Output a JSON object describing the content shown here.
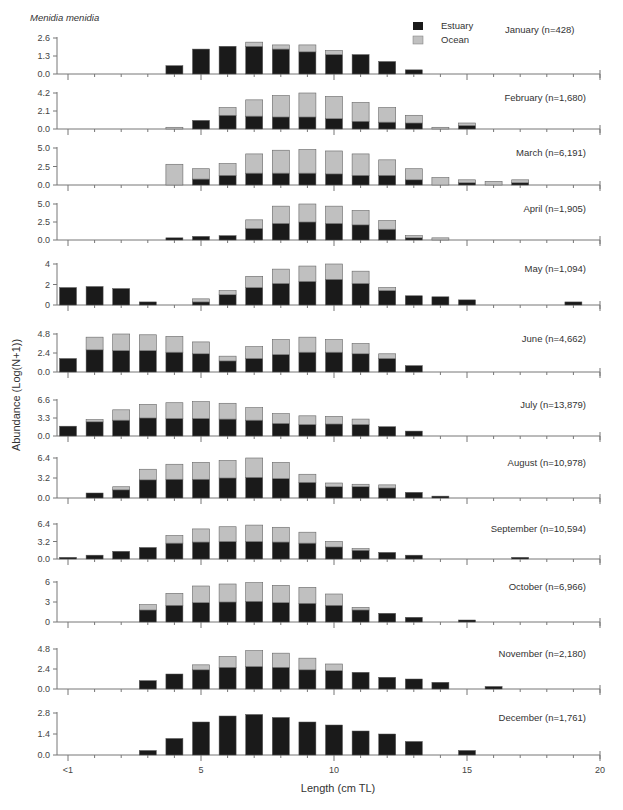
{
  "chart_data": {
    "type": "bar",
    "stacked": true,
    "title": "Menidia menidia",
    "xlabel": "Length (cm TL)",
    "ylabel": "Abundance (Log(N+1))",
    "categories": [
      "<1",
      "1",
      "2",
      "3",
      "4",
      "5",
      "6",
      "7",
      "8",
      "9",
      "10",
      "11",
      "12",
      "13",
      "14",
      "15",
      "16",
      "17",
      "18",
      "19",
      "20"
    ],
    "x_tick_labels": {
      "0": "<1",
      "5": "5",
      "10": "10",
      "15": "15",
      "20": "20"
    },
    "legend": [
      {
        "name": "Estuary",
        "color": "#1a1a1a"
      },
      {
        "name": "Ocean",
        "color": "#c0c0c0"
      }
    ],
    "legend_position": "top-right",
    "grid": false,
    "panels": [
      {
        "label": "January (n=428)",
        "yticks": [
          "0.0",
          "1.3",
          "2.6"
        ],
        "ylim": [
          0,
          2.6
        ],
        "series": [
          {
            "name": "Estuary",
            "values": [
              0,
              0,
              0,
              0,
              0.6,
              1.8,
              2.0,
              2.0,
              1.8,
              1.6,
              1.4,
              1.4,
              0.9,
              0.3,
              0,
              0,
              0,
              0,
              0,
              0,
              0
            ]
          },
          {
            "name": "Ocean",
            "values": [
              0,
              0,
              0,
              0,
              0,
              0,
              0,
              0.3,
              0.3,
              0.5,
              0.3,
              0,
              0,
              0,
              0,
              0,
              0,
              0,
              0,
              0,
              0
            ]
          }
        ]
      },
      {
        "label": "February (n=1,680)",
        "yticks": [
          "0.0",
          "2.1",
          "4.2"
        ],
        "ylim": [
          0,
          4.2
        ],
        "series": [
          {
            "name": "Estuary",
            "values": [
              0,
              0,
              0,
              0,
              0,
              1.0,
              1.6,
              1.5,
              1.4,
              1.4,
              1.2,
              0.9,
              0.8,
              0.7,
              0,
              0.4,
              0,
              0,
              0,
              0,
              0
            ]
          },
          {
            "name": "Ocean",
            "values": [
              0,
              0,
              0,
              0,
              0.2,
              0,
              0.9,
              1.9,
              2.5,
              2.8,
              2.6,
              2.2,
              1.7,
              0.9,
              0.2,
              0.3,
              0,
              0,
              0,
              0,
              0
            ]
          }
        ]
      },
      {
        "label": "March (n=6,191)",
        "yticks": [
          "0.0",
          "2.5",
          "5.0"
        ],
        "ylim": [
          0,
          5.0
        ],
        "series": [
          {
            "name": "Estuary",
            "values": [
              0,
              0,
              0,
              0,
              0,
              0.8,
              1.3,
              1.6,
              1.6,
              1.6,
              1.5,
              1.3,
              1.3,
              0.7,
              0,
              0.3,
              0,
              0.3,
              0,
              0,
              0
            ]
          },
          {
            "name": "Ocean",
            "values": [
              0,
              0,
              0,
              0,
              2.8,
              1.4,
              1.6,
              2.6,
              3.1,
              3.2,
              3.1,
              2.9,
              2.1,
              1.5,
              1.0,
              0.4,
              0.5,
              0.4,
              0,
              0,
              0
            ]
          }
        ]
      },
      {
        "label": "April (n=1,905)",
        "yticks": [
          "0.0",
          "2.5",
          "5.0"
        ],
        "ylim": [
          0,
          5.0
        ],
        "series": [
          {
            "name": "Estuary",
            "values": [
              0,
              0,
              0,
              0,
              0.3,
              0.5,
              0.6,
              1.6,
              2.3,
              2.5,
              2.3,
              2.1,
              1.5,
              0.3,
              0,
              0,
              0,
              0,
              0,
              0,
              0
            ]
          },
          {
            "name": "Ocean",
            "values": [
              0,
              0,
              0,
              0,
              0,
              0,
              0,
              1.2,
              2.4,
              2.5,
              2.4,
              2.0,
              1.2,
              0.3,
              0.3,
              0,
              0,
              0,
              0,
              0,
              0
            ]
          }
        ]
      },
      {
        "label": "May (n=1,094)",
        "yticks": [
          "0",
          "2",
          "4"
        ],
        "ylim": [
          0,
          4
        ],
        "series": [
          {
            "name": "Estuary",
            "values": [
              1.7,
              1.8,
              1.6,
              0.3,
              0,
              0.3,
              1.0,
              1.7,
              2.1,
              2.3,
              2.5,
              2.1,
              1.4,
              0.9,
              0.8,
              0.5,
              0,
              0,
              0,
              0.3,
              0
            ]
          },
          {
            "name": "Ocean",
            "values": [
              0,
              0,
              0,
              0,
              0,
              0.3,
              0.4,
              1.1,
              1.4,
              1.5,
              1.5,
              1.2,
              0.3,
              0,
              0,
              0,
              0,
              0,
              0,
              0,
              0
            ]
          }
        ]
      },
      {
        "label": "June (n=4,662)",
        "yticks": [
          "0.0",
          "2.4",
          "4.8"
        ],
        "ylim": [
          0,
          4.8
        ],
        "series": [
          {
            "name": "Estuary",
            "values": [
              1.7,
              2.8,
              2.7,
              2.7,
              2.5,
              2.3,
              1.4,
              1.7,
              2.2,
              2.5,
              2.5,
              2.3,
              1.7,
              0.8,
              0,
              0,
              0,
              0,
              0,
              0,
              0
            ]
          },
          {
            "name": "Ocean",
            "values": [
              0,
              1.6,
              2.1,
              2.0,
              2.0,
              1.5,
              0.6,
              1.5,
              1.9,
              1.9,
              1.6,
              1.3,
              0.6,
              0,
              0,
              0,
              0,
              0,
              0,
              0,
              0
            ]
          }
        ]
      },
      {
        "label": "July (n=13,879)",
        "yticks": [
          "0.0",
          "3.3",
          "6.6"
        ],
        "ylim": [
          0,
          6.6
        ],
        "series": [
          {
            "name": "Estuary",
            "values": [
              1.8,
              2.6,
              2.9,
              3.3,
              3.2,
              3.2,
              3.1,
              2.9,
              2.3,
              2.1,
              2.2,
              2.1,
              1.7,
              0.9,
              0,
              0,
              0,
              0,
              0,
              0,
              0
            ]
          },
          {
            "name": "Ocean",
            "values": [
              0,
              0.4,
              1.9,
              2.5,
              2.9,
              3.1,
              2.9,
              2.3,
              1.8,
              1.6,
              1.4,
              1.0,
              0,
              0,
              0,
              0,
              0,
              0,
              0,
              0,
              0
            ]
          }
        ]
      },
      {
        "label": "August (n=10,978)",
        "yticks": [
          "0.0",
          "3.2",
          "6.4"
        ],
        "ylim": [
          0,
          6.4
        ],
        "series": [
          {
            "name": "Estuary",
            "values": [
              0,
              0.8,
              1.3,
              2.9,
              3.0,
              3.0,
              3.2,
              3.3,
              3.1,
              2.5,
              1.8,
              1.8,
              1.6,
              0.9,
              0.3,
              0,
              0,
              0,
              0,
              0,
              0
            ]
          },
          {
            "name": "Ocean",
            "values": [
              0,
              0,
              0.5,
              1.7,
              2.4,
              2.7,
              2.8,
              3.1,
              2.6,
              1.3,
              0.6,
              0.4,
              0.5,
              0,
              0,
              0,
              0,
              0,
              0,
              0,
              0
            ]
          }
        ]
      },
      {
        "label": "September (n=10,594)",
        "yticks": [
          "0.0",
          "3.2",
          "6.4"
        ],
        "ylim": [
          0,
          6.4
        ],
        "series": [
          {
            "name": "Estuary",
            "values": [
              0.3,
              0.7,
              1.4,
              2.1,
              2.9,
              3.1,
              3.2,
              3.2,
              3.1,
              2.9,
              2.2,
              1.6,
              1.2,
              0.7,
              0,
              0,
              0,
              0.3,
              0,
              0,
              0
            ]
          },
          {
            "name": "Ocean",
            "values": [
              0,
              0,
              0,
              0,
              1.4,
              2.4,
              2.7,
              3.0,
              2.7,
              2.0,
              1.0,
              0.3,
              0,
              0,
              0,
              0,
              0,
              0,
              0,
              0,
              0
            ]
          }
        ]
      },
      {
        "label": "October (n=6,966)",
        "yticks": [
          "0",
          "3",
          "6"
        ],
        "ylim": [
          0,
          6
        ],
        "series": [
          {
            "name": "Estuary",
            "values": [
              0,
              0,
              0,
              1.8,
              2.5,
              2.9,
              3.0,
              3.1,
              2.9,
              2.8,
              2.5,
              1.8,
              1.3,
              0.7,
              0,
              0.3,
              0,
              0,
              0,
              0,
              0
            ]
          },
          {
            "name": "Ocean",
            "values": [
              0,
              0,
              0,
              0.8,
              1.8,
              2.5,
              2.7,
              2.8,
              2.6,
              2.4,
              1.7,
              0.4,
              0,
              0,
              0,
              0,
              0,
              0,
              0,
              0,
              0
            ]
          }
        ]
      },
      {
        "label": "November (n=2,180)",
        "yticks": [
          "0.0",
          "2.4",
          "4.8"
        ],
        "ylim": [
          0,
          4.8
        ],
        "series": [
          {
            "name": "Estuary",
            "values": [
              0,
              0,
              0,
              1.0,
              1.8,
              2.3,
              2.6,
              2.7,
              2.6,
              2.3,
              2.2,
              2.0,
              1.4,
              1.2,
              0.8,
              0,
              0.3,
              0,
              0,
              0,
              0
            ]
          },
          {
            "name": "Ocean",
            "values": [
              0,
              0,
              0,
              0,
              0,
              0.6,
              1.3,
              1.9,
              1.7,
              1.4,
              0.8,
              0,
              0,
              0,
              0,
              0,
              0,
              0,
              0,
              0,
              0
            ]
          }
        ]
      },
      {
        "label": "December (n=1,761)",
        "yticks": [
          "0.0",
          "1.4",
          "2.8"
        ],
        "ylim": [
          0,
          2.8
        ],
        "series": [
          {
            "name": "Estuary",
            "values": [
              0,
              0,
              0,
              0.3,
              1.1,
              2.2,
              2.6,
              2.7,
              2.5,
              2.2,
              2.0,
              1.6,
              1.4,
              0.9,
              0,
              0.3,
              0,
              0,
              0,
              0,
              0
            ]
          },
          {
            "name": "Ocean",
            "values": [
              0,
              0,
              0,
              0,
              0,
              0,
              0,
              0,
              0,
              0,
              0,
              0,
              0,
              0,
              0,
              0,
              0,
              0,
              0,
              0,
              0
            ]
          }
        ]
      }
    ]
  },
  "header": {
    "species": "Menidia menidia",
    "legend": {
      "estuary_label": "Estuary",
      "ocean_label": "Ocean"
    }
  },
  "axes": {
    "xlabel": "Length (cm TL)",
    "ylabel": "Abundance (Log(N+1))"
  }
}
